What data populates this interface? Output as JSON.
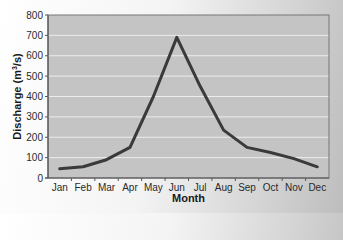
{
  "chart_data": {
    "type": "line",
    "title": "",
    "xlabel": "Month",
    "ylabel": "Discharge (m³/s)",
    "ylabel_parts": {
      "before": "Discharge (m",
      "sup": "3",
      "after": "/s)"
    },
    "categories": [
      "Jan",
      "Feb",
      "Mar",
      "Apr",
      "May",
      "Jun",
      "Jul",
      "Aug",
      "Sep",
      "Oct",
      "Nov",
      "Dec"
    ],
    "series": [
      {
        "name": "Discharge",
        "values": [
          45,
          55,
          90,
          150,
          400,
          690,
          450,
          235,
          150,
          125,
          95,
          55
        ]
      }
    ],
    "ylim": [
      0,
      800
    ],
    "yticks": [
      0,
      100,
      200,
      300,
      400,
      500,
      600,
      700,
      800
    ],
    "grid": true,
    "legend": null
  },
  "colors": {
    "plot_background": "#c4c4c4",
    "gridline": "#ececec",
    "line": "#3a3a3a",
    "axis": "#555555",
    "frame": "#777777"
  }
}
